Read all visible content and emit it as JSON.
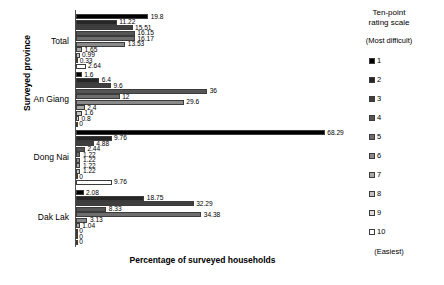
{
  "chart_data": {
    "type": "bar",
    "orientation": "horizontal",
    "title": "",
    "xlabel": "Percentage of surveyed households",
    "ylabel": "Surveyed province",
    "xlim": [
      0,
      70
    ],
    "grid": false,
    "legend_position": "right",
    "legend_title": "Ten-point rating scale",
    "legend_top_note": "(Most difficult)",
    "legend_bottom_note": "(Easiest)",
    "categories": [
      "Total",
      "An Giang",
      "Dong Nai",
      "Dak Lak"
    ],
    "series": [
      {
        "name": "1",
        "color": "#000000",
        "values": [
          19.8,
          1.6,
          68.29,
          2.08
        ]
      },
      {
        "name": "2",
        "color": "#262626",
        "values": [
          11.22,
          6.4,
          9.76,
          18.75
        ]
      },
      {
        "name": "3",
        "color": "#3f3f3f",
        "values": [
          15.51,
          9.6,
          4.88,
          32.29
        ]
      },
      {
        "name": "4",
        "color": "#555555",
        "values": [
          16.15,
          36,
          2.44,
          8.33
        ]
      },
      {
        "name": "5",
        "color": "#6e6e6e",
        "values": [
          16.17,
          12,
          1.22,
          34.38
        ]
      },
      {
        "name": "6",
        "color": "#8a8a8a",
        "values": [
          13.53,
          29.6,
          1.22,
          3.13
        ]
      },
      {
        "name": "7",
        "color": "#a8a8a8",
        "values": [
          1.65,
          2.4,
          1.22,
          1.04
        ]
      },
      {
        "name": "8",
        "color": "#c2c2c2",
        "values": [
          0.99,
          1.6,
          1.22,
          0
        ]
      },
      {
        "name": "9",
        "color": "#dcdcdc",
        "values": [
          0.33,
          0.8,
          0,
          0
        ]
      },
      {
        "name": "10",
        "color": "#ffffff",
        "values": [
          2.64,
          0,
          9.76,
          0
        ]
      }
    ],
    "value_labels": {
      "Total": [
        "19.8",
        "11.22",
        "15.51",
        "16.15",
        "16.17",
        "13.53",
        "1.65",
        "0.99",
        "0.33",
        "2.64"
      ],
      "An Giang": [
        "1.6",
        "6.4",
        "9.6",
        "36",
        "12",
        "29.6",
        "2.4",
        "1.6",
        "0.8",
        "0"
      ],
      "Dong Nai": [
        "68.29",
        "9.76",
        "4.88",
        "2.44",
        "1.22",
        "1.22",
        "1.22",
        "1.22",
        "0",
        "9.76"
      ],
      "Dak Lak": [
        "2.08",
        "18.75",
        "32.29",
        "8.33",
        "34.38",
        "3.13",
        "1.04",
        "0",
        "0",
        "0"
      ]
    }
  },
  "legend": {
    "title_line1": "Ten-point",
    "title_line2": "rating scale",
    "most_difficult": "(Most difficult)",
    "easiest": "(Easiest)",
    "items": [
      {
        "label": "1"
      },
      {
        "label": "2"
      },
      {
        "label": "3"
      },
      {
        "label": "4"
      },
      {
        "label": "5"
      },
      {
        "label": "6"
      },
      {
        "label": "7"
      },
      {
        "label": "8"
      },
      {
        "label": "9"
      },
      {
        "label": "10"
      }
    ]
  },
  "axes": {
    "x_title": "Percentage of surveyed households",
    "y_title": "Surveyed province"
  }
}
